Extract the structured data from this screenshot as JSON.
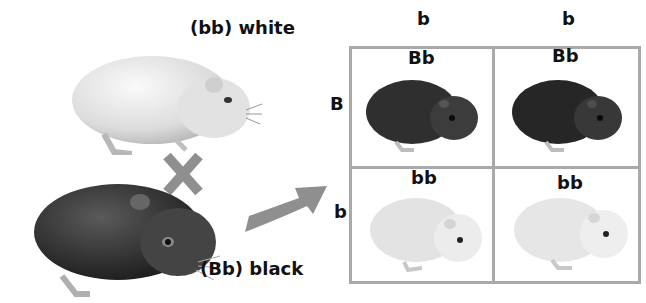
{
  "parents": [
    {
      "genotype_label": "(bb) white",
      "genotype": "bb",
      "phenotype": "white"
    },
    {
      "genotype_label": "(Bb) black",
      "genotype": "Bb",
      "phenotype": "black"
    }
  ],
  "cross_symbol": "×",
  "punnett": {
    "column_alleles": [
      "b",
      "b"
    ],
    "row_alleles": [
      "B",
      "b"
    ],
    "cells": [
      [
        {
          "genotype": "Bb",
          "phenotype": "black"
        },
        {
          "genotype": "Bb",
          "phenotype": "black"
        }
      ],
      [
        {
          "genotype": "bb",
          "phenotype": "white"
        },
        {
          "genotype": "bb",
          "phenotype": "white"
        }
      ]
    ]
  },
  "colors": {
    "grid": "#a9a9a9",
    "symbol": "#8f8f8f",
    "black_coat": "#2e2e2e",
    "white_coat": "#e6e6e6",
    "text": "#111111"
  }
}
